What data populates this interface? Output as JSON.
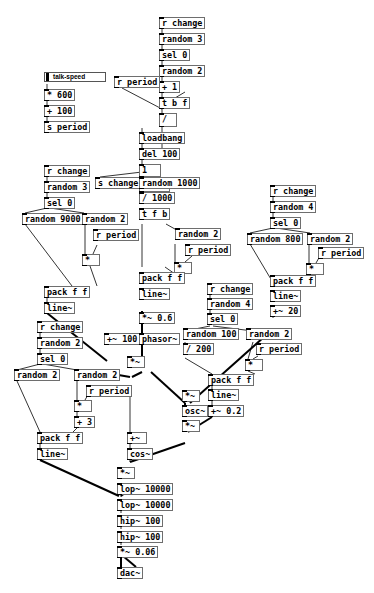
{
  "patch": {
    "slider": {
      "label": "talk-speed"
    },
    "objects": {
      "o_rchange1": "r change",
      "o_random3a": "random 3",
      "o_sel0a": "sel 0",
      "o_random2a": "random 2",
      "o_plus1": "+ 1",
      "o_tbf": "t b f",
      "o_rperiod_top": "r period",
      "o_div": "/",
      "o_loadbang": "loadbang",
      "o_del100": "del 100",
      "o_msg1": "1",
      "o_metro": "metro",
      "o_schange": "s change",
      "o_random1000": "random 1000",
      "o_div1000": "/ 1000",
      "o_tfb": "t f b",
      "o_mul600": "* 600",
      "o_plus100": "+ 100",
      "o_speriod": "s period",
      "o_rchange2": "r change",
      "o_random3b": "random 3",
      "o_sel0b": "sel 0",
      "o_random9000": "random 9000",
      "o_random2b": "random 2",
      "o_rperiod_b": "r period",
      "o_mul_b": "*",
      "o_pack_b": "pack f f",
      "o_line_b": "line~",
      "o_random2c": "random 2",
      "o_rperiod_c": "r period",
      "o_mul_c": "*",
      "o_pack_c": "pack f f",
      "o_line_c": "line~",
      "o_mulsig06": "*~ 0.6",
      "o_rchange3": "r change",
      "o_random4a": "random 4",
      "o_sel0c": "sel 0",
      "o_random800": "random 800",
      "o_random2d": "random 2",
      "o_rperiod_d": "r period",
      "o_mul_d": "*",
      "o_pack_d": "pack f f",
      "o_line_d": "line~",
      "o_addsig20": "+~ 20",
      "o_rchange4": "r change",
      "o_random4b": "random 4",
      "o_sel0d": "sel 0",
      "o_random100": "random 100",
      "o_div200": "/ 200",
      "o_random2e": "random 2",
      "o_rperiod_e": "r period",
      "o_mul_e": "*",
      "o_pack_e": "pack f f",
      "o_line_e": "line~",
      "o_addsig02": "+~ 0.2",
      "o_addsig100": "+~ 100",
      "o_phasor": "phasor~",
      "o_mulsig_a": "*~",
      "o_mulsig_b": "*~",
      "o_osc": "osc~",
      "o_mulsig_c": "*~",
      "o_rchange5": "r change",
      "o_random2f": "random 2",
      "o_sel0e": "sel 0",
      "o_random2g": "random 2",
      "o_random2h": "random 2",
      "o_rperiod_f": "r period",
      "o_mul_f": "*",
      "o_plus3": "+ 3",
      "o_pack_f": "pack f f",
      "o_line_f": "line~",
      "o_addsig_final": "+~",
      "o_cos": "cos~",
      "o_mulsig_out": "*~",
      "o_lop1": "lop~ 10000",
      "o_lop2": "lop~ 10000",
      "o_hip1": "hip~ 100",
      "o_hip2": "hip~ 100",
      "o_mulsig006": "*~ 0.06",
      "o_dac": "dac~"
    }
  }
}
